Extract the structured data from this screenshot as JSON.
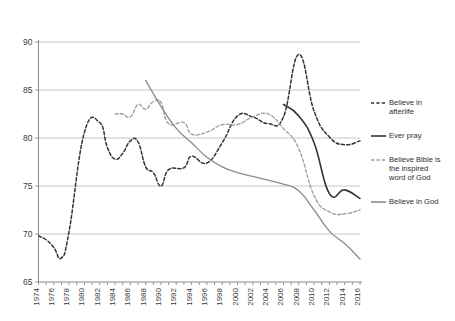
{
  "chart_data": {
    "type": "line",
    "title": "",
    "subtitle": "",
    "xlabel": "",
    "ylabel": "",
    "xlim": [
      1974,
      2016
    ],
    "ylim": [
      65,
      90
    ],
    "grid": true,
    "legend_position": "right",
    "y_ticks": [
      65,
      70,
      75,
      80,
      85,
      90
    ],
    "x_ticks": [
      1974,
      1976,
      1978,
      1980,
      1982,
      1984,
      1986,
      1988,
      1990,
      1992,
      1994,
      1996,
      1998,
      2000,
      2002,
      2004,
      2006,
      2008,
      2010,
      2012,
      2014,
      2016
    ],
    "series": [
      {
        "name": "Believe in afterlife",
        "color": "#333333",
        "style": "dashed",
        "width": 1.5,
        "x": [
          1974,
          1975,
          1976,
          1977,
          1978,
          1980,
          1982,
          1983,
          1984,
          1985,
          1986,
          1987,
          1988,
          1989,
          1990,
          1991,
          1993,
          1994,
          1996,
          1998,
          2000,
          2002,
          2004,
          2006,
          2008,
          2010,
          2012,
          2014,
          2016
        ],
        "values": [
          69.8,
          69.4,
          68.6,
          67.5,
          70.3,
          80.6,
          81.6,
          79.0,
          77.8,
          78.4,
          79.7,
          79.6,
          77.0,
          76.4,
          75.0,
          76.7,
          76.9,
          78.1,
          77.4,
          79.5,
          82.3,
          82.2,
          81.5,
          82.2,
          88.7,
          82.8,
          80.1,
          79.3,
          79.7
        ]
      },
      {
        "name": "Ever pray",
        "color": "#333333",
        "style": "solid",
        "width": 1.6,
        "x": [
          2006,
          2008,
          2010,
          2012,
          2014,
          2016
        ],
        "values": [
          83.5,
          82.3,
          79.5,
          74.2,
          74.6,
          73.7
        ]
      },
      {
        "name": "Believe Bible is the inspired word of God",
        "color": "#9a9a9a",
        "style": "dashed",
        "width": 1.3,
        "x": [
          1984,
          1985,
          1986,
          1987,
          1988,
          1989,
          1990,
          1991,
          1993,
          1994,
          1996,
          1998,
          2000,
          2002,
          2004,
          2006,
          2008,
          2010,
          2012,
          2014,
          2016
        ],
        "values": [
          82.5,
          82.5,
          82.2,
          83.5,
          83.0,
          83.8,
          83.7,
          81.5,
          81.6,
          80.4,
          80.6,
          81.4,
          81.4,
          82.2,
          82.5,
          81.0,
          78.9,
          74.0,
          72.3,
          72.1,
          72.5
        ]
      },
      {
        "name": "Believe in God",
        "color": "#8b8b8b",
        "style": "solid",
        "width": 1.3,
        "x": [
          1988,
          1990,
          1992,
          1994,
          1996,
          1998,
          2000,
          2002,
          2004,
          2006,
          2008,
          2010,
          2012,
          2014,
          2016
        ],
        "values": [
          86.0,
          83.3,
          81.0,
          79.5,
          78.0,
          77.0,
          76.4,
          76.0,
          75.6,
          75.2,
          74.5,
          72.5,
          70.3,
          69.0,
          67.4
        ]
      }
    ],
    "legend": [
      {
        "label": "Believe in afterlife",
        "color": "#333333",
        "style": "dashed"
      },
      {
        "label": "Ever pray",
        "color": "#333333",
        "style": "solid"
      },
      {
        "label": "Believe Bible is the inspired word of God",
        "color": "#9a9a9a",
        "style": "dashed"
      },
      {
        "label": "Believe in God",
        "color": "#8b8b8b",
        "style": "solid"
      }
    ]
  },
  "legend_lines": [
    [
      "Believe in",
      "afterlife"
    ],
    [
      "Ever pray"
    ],
    [
      "Believe Bible is",
      "the inspired",
      "word of God"
    ],
    [
      "Believe in God"
    ]
  ]
}
